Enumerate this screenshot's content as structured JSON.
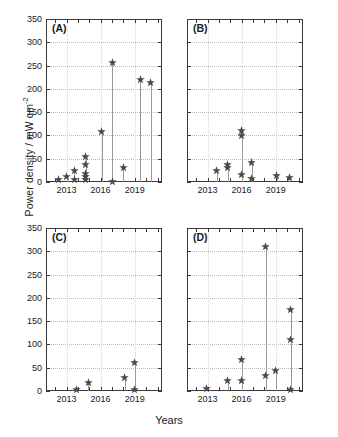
{
  "figure": {
    "ylabel": "Power density / mW cm",
    "ylabel_exponent": "-2",
    "xlabel": "Years",
    "marker_color": "#4a4a4a",
    "stem_color": "#9a9a9a",
    "grid_color": "#b9b9b9",
    "axis_color": "#3a3a3a"
  },
  "chart_data": {
    "type": "scatter",
    "title": "",
    "xlabel": "Years",
    "ylabel": "Power density / mW cm^-2",
    "xlim": [
      2011.2,
      2021.4
    ],
    "ylim": [
      0,
      350
    ],
    "yticks": [
      0,
      50,
      100,
      150,
      200,
      250,
      300,
      350
    ],
    "xticks": [
      2012,
      2013,
      2014,
      2015,
      2016,
      2017,
      2018,
      2019,
      2020,
      2021
    ],
    "xticklabels": [
      "",
      "2013",
      "",
      "",
      "2016",
      "",
      "",
      "2019",
      "",
      ""
    ],
    "grid": true,
    "legend": null,
    "style": "stem-with-star-markers",
    "panels": [
      {
        "label": "(A)",
        "x": [
          2012.3,
          2013.0,
          2013.7,
          2014.3,
          2014.7,
          2014.7,
          2014.7,
          2014.7,
          2014.7,
          2016.1,
          2017.0,
          2018.0,
          2019.5,
          2020.4
        ],
        "y": [
          5,
          11,
          6,
          24,
          55,
          38,
          18,
          11,
          5,
          108,
          256,
          2,
          31,
          221,
          214
        ],
        "points": [
          {
            "x": 2012.3,
            "y": 5
          },
          {
            "x": 2013.0,
            "y": 11
          },
          {
            "x": 2013.7,
            "y": 6
          },
          {
            "x": 2013.7,
            "y": 24
          },
          {
            "x": 2014.7,
            "y": 55
          },
          {
            "x": 2014.7,
            "y": 38
          },
          {
            "x": 2014.7,
            "y": 18
          },
          {
            "x": 2014.7,
            "y": 11
          },
          {
            "x": 2014.7,
            "y": 5
          },
          {
            "x": 2016.1,
            "y": 108
          },
          {
            "x": 2017.0,
            "y": 256
          },
          {
            "x": 2017.0,
            "y": 2
          },
          {
            "x": 2018.0,
            "y": 31
          },
          {
            "x": 2019.5,
            "y": 221
          },
          {
            "x": 2020.4,
            "y": 214
          }
        ]
      },
      {
        "label": "(B)",
        "points": [
          {
            "x": 2013.8,
            "y": 25
          },
          {
            "x": 2014.8,
            "y": 38
          },
          {
            "x": 2014.8,
            "y": 31
          },
          {
            "x": 2016.0,
            "y": 110
          },
          {
            "x": 2016.0,
            "y": 100
          },
          {
            "x": 2016.0,
            "y": 17
          },
          {
            "x": 2016.9,
            "y": 42
          },
          {
            "x": 2016.9,
            "y": 8
          },
          {
            "x": 2019.1,
            "y": 13
          },
          {
            "x": 2020.2,
            "y": 9
          }
        ]
      },
      {
        "label": "(C)",
        "points": [
          {
            "x": 2013.9,
            "y": 3
          },
          {
            "x": 2014.9,
            "y": 19
          },
          {
            "x": 2018.1,
            "y": 30
          },
          {
            "x": 2019.0,
            "y": 62
          },
          {
            "x": 2019.0,
            "y": 4
          }
        ]
      },
      {
        "label": "(D)",
        "points": [
          {
            "x": 2012.9,
            "y": 5
          },
          {
            "x": 2014.8,
            "y": 22
          },
          {
            "x": 2016.0,
            "y": 67
          },
          {
            "x": 2016.0,
            "y": 23
          },
          {
            "x": 2018.1,
            "y": 311
          },
          {
            "x": 2018.1,
            "y": 33
          },
          {
            "x": 2019.0,
            "y": 44
          },
          {
            "x": 2020.3,
            "y": 175
          },
          {
            "x": 2020.3,
            "y": 110
          },
          {
            "x": 2020.3,
            "y": 4
          }
        ]
      }
    ]
  }
}
